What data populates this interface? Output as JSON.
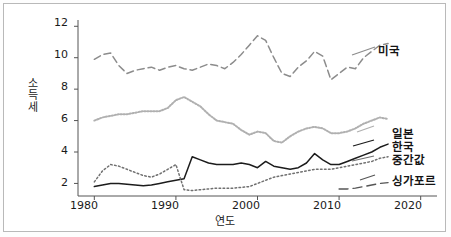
{
  "chart_data": {
    "type": "line",
    "title": "",
    "xlabel": "연도",
    "ylabel": "소득세",
    "xlim": [
      1978,
      2022
    ],
    "ylim": [
      1.2,
      12.4
    ],
    "grid": false,
    "legend_position": "right-inline",
    "xticks": [
      "1980",
      "1990",
      "2000",
      "2010",
      "2020"
    ],
    "xtick_values": [
      1980,
      1990,
      2000,
      2010,
      2020
    ],
    "yticks": [
      "2",
      "4",
      "6",
      "8",
      "10",
      "12"
    ],
    "ytick_values": [
      2,
      4,
      6,
      8,
      10,
      12
    ],
    "x": [
      1980,
      1981,
      1982,
      1983,
      1984,
      1985,
      1986,
      1987,
      1988,
      1989,
      1990,
      1991,
      1992,
      1993,
      1994,
      1995,
      1996,
      1997,
      1998,
      1999,
      2000,
      2001,
      2002,
      2003,
      2004,
      2005,
      2006,
      2007,
      2008,
      2009,
      2010,
      2011,
      2012,
      2013,
      2014,
      2015,
      2016
    ],
    "series": [
      {
        "name": "미국",
        "label": "미국",
        "style": "dashed",
        "color": "#8c8c8c",
        "values": [
          9.9,
          10.2,
          10.3,
          9.5,
          9.0,
          9.2,
          9.3,
          9.4,
          9.2,
          9.4,
          9.5,
          9.3,
          9.2,
          9.4,
          9.6,
          9.5,
          9.3,
          9.7,
          10.2,
          10.8,
          11.4,
          11.1,
          10.0,
          9.0,
          8.8,
          9.4,
          9.8,
          10.4,
          10.1,
          8.6,
          9.0,
          9.4,
          9.3,
          10.0,
          10.4,
          10.8,
          10.9
        ]
      },
      {
        "name": "일본",
        "label": "일본",
        "style": "dotted-light",
        "color": "#b0b0b0",
        "values": [
          6.0,
          6.2,
          6.3,
          6.4,
          6.4,
          6.5,
          6.6,
          6.6,
          6.6,
          6.8,
          7.3,
          7.5,
          7.2,
          6.9,
          6.4,
          6.0,
          5.9,
          5.8,
          5.4,
          5.1,
          5.3,
          5.2,
          4.7,
          4.6,
          5.0,
          5.3,
          5.5,
          5.6,
          5.5,
          5.2,
          5.2,
          5.3,
          5.5,
          5.8,
          6.0,
          6.2,
          6.1
        ]
      },
      {
        "name": "한국",
        "label": "한국",
        "style": "solid",
        "color": "#1c1c1c",
        "values": [
          1.8,
          1.9,
          2.0,
          2.0,
          1.95,
          1.9,
          1.85,
          1.9,
          2.0,
          2.1,
          2.2,
          2.3,
          3.7,
          3.5,
          3.3,
          3.2,
          3.2,
          3.2,
          3.3,
          3.2,
          3.0,
          3.4,
          3.1,
          3.0,
          2.9,
          3.0,
          3.3,
          3.9,
          3.5,
          3.2,
          3.2,
          3.4,
          3.6,
          3.8,
          4.0,
          4.3,
          4.5
        ]
      },
      {
        "name": "중간값",
        "label": "중간값",
        "style": "dotted",
        "color": "#707070",
        "values": [
          2.1,
          2.8,
          3.2,
          3.1,
          2.9,
          2.7,
          2.5,
          2.4,
          2.6,
          2.9,
          3.2,
          1.6,
          1.55,
          1.6,
          1.65,
          1.7,
          1.7,
          1.7,
          1.75,
          1.8,
          2.0,
          2.2,
          2.4,
          2.5,
          2.6,
          2.7,
          2.8,
          2.9,
          2.9,
          2.9,
          3.0,
          3.1,
          3.2,
          3.3,
          3.4,
          3.6,
          3.7
        ]
      },
      {
        "name": "싱가포르",
        "label": "싱가포르",
        "style": "dashed-long",
        "color": "#555555",
        "values": [
          null,
          null,
          null,
          null,
          null,
          null,
          null,
          null,
          null,
          null,
          null,
          null,
          null,
          null,
          null,
          null,
          null,
          null,
          null,
          null,
          null,
          null,
          null,
          null,
          null,
          null,
          null,
          null,
          null,
          null,
          1.65,
          1.65,
          1.7,
          1.8,
          1.9,
          2.0,
          2.05
        ]
      }
    ]
  },
  "labels": {
    "usa": "미국",
    "japan": "일본",
    "korea": "한국",
    "median": "중간값",
    "singapore": "싱가포르",
    "ylabel": "소득세",
    "xlabel": "연도"
  },
  "axis": {
    "ytick_0": "2",
    "ytick_1": "4",
    "ytick_2": "6",
    "ytick_3": "8",
    "ytick_4": "10",
    "ytick_5": "12",
    "xtick_0": "1980",
    "xtick_1": "1990",
    "xtick_2": "2000",
    "xtick_3": "2010",
    "xtick_4": "2020"
  }
}
